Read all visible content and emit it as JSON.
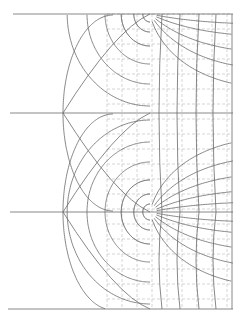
{
  "diagram": {
    "type": "conformal-mapping-flow-net",
    "colors": {
      "background": "#ffffff",
      "line": "#6a6a6a",
      "dark_line": "#4a4a4a",
      "dashed_grid": "#b8b8b8"
    },
    "horizontal_lines": [
      {
        "y": 14,
        "x1": 13,
        "x2": 233
      },
      {
        "y": 113,
        "x1": 10,
        "x2": 233
      },
      {
        "y": 212,
        "x1": 10,
        "x2": 233
      },
      {
        "y": 309,
        "x1": 8,
        "x2": 233
      }
    ],
    "right_edge_x": 232,
    "singularities": [
      {
        "x": 150,
        "y": 14
      },
      {
        "x": 150,
        "y": 212
      }
    ],
    "dashed_grid": {
      "x_start": 107,
      "x_end": 232,
      "x_step": 15,
      "y_start": 14,
      "y_end": 309,
      "y_step": 15
    }
  }
}
